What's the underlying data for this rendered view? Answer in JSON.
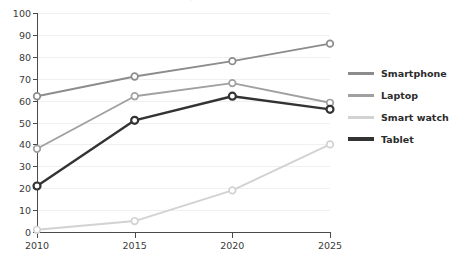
{
  "chart_data": {
    "type": "line",
    "title": "Device ownership (%)",
    "xlabel": "",
    "ylabel": "",
    "categories": [
      2010,
      2015,
      2020,
      2025
    ],
    "x_tick_labels": [
      "2010",
      "2015",
      "2020",
      "2025"
    ],
    "y_tick_labels": [
      "0",
      "10",
      "20",
      "30",
      "40",
      "50",
      "60",
      "70",
      "80",
      "90",
      "100"
    ],
    "y_ticks": [
      0,
      10,
      20,
      30,
      40,
      50,
      60,
      70,
      80,
      90,
      100
    ],
    "ylim": [
      0,
      100
    ],
    "xlim": [
      2010,
      2025
    ],
    "grid": "horizontal",
    "legend_position": "right",
    "markers": "open-circle",
    "series": [
      {
        "name": "Smartphone",
        "color": "#8c8c8c",
        "values": [
          62,
          71,
          78,
          86
        ]
      },
      {
        "name": "Laptop",
        "color": "#a0a0a0",
        "values": [
          38,
          62,
          68,
          59
        ]
      },
      {
        "name": "Smart watch",
        "color": "#d2d2d2",
        "values": [
          1,
          5,
          19,
          40
        ]
      },
      {
        "name": "Tablet",
        "color": "#333333",
        "values": [
          21,
          51,
          62,
          56
        ]
      }
    ]
  },
  "legend": {
    "items": [
      {
        "label": "Smartphone",
        "color": "#8c8c8c"
      },
      {
        "label": "Laptop",
        "color": "#a0a0a0"
      },
      {
        "label": "Smart watch",
        "color": "#d2d2d2"
      },
      {
        "label": "Tablet",
        "color": "#333333"
      }
    ]
  },
  "axes": {
    "y_labels": [
      "100",
      "90",
      "80",
      "70",
      "60",
      "50",
      "40",
      "30",
      "20",
      "10",
      "0"
    ],
    "x_labels": [
      "2010",
      "2015",
      "2020",
      "2025"
    ]
  }
}
